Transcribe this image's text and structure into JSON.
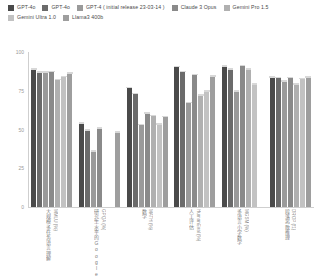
{
  "legend": {
    "items": [
      {
        "label": "GPT-4o",
        "color": "#4a4a4a"
      },
      {
        "label": "GPT-4o",
        "color": "#6b6b6b"
      },
      {
        "label": "GPT-4 ( initial release 23-03-14 )",
        "color": "#9a9a9a"
      },
      {
        "label": "Claude 3 Opus",
        "color": "#8a8a8a"
      },
      {
        "label": "Gemini Pro 1.5",
        "color": "#b0b0b0"
      },
      {
        "label": "Gemini Ultra 1.0",
        "color": "#c2c2c2"
      },
      {
        "label": "Llama3 400b",
        "color": "#9e9e9e"
      }
    ]
  },
  "chart_data": {
    "type": "bar",
    "title": "",
    "xlabel": "",
    "ylabel": "",
    "ylim": [
      0,
      100
    ],
    "yticks": [
      "0",
      "25",
      "50",
      "75",
      "100"
    ],
    "grid": false,
    "legend_position": "top-left",
    "categories": [
      "大规模多任务语言理解 MMLU (%)",
      "研究生水平的Google-Proof问答基准测试 GPQA (%)",
      "数学 MATH (%)",
      "人工评估 HumanEval (%)",
      "多语言小学数学 MGSM (%)",
      "段落离散推理 DROP (f1)"
    ],
    "category_labels": [
      {
        "cjk": "大规模多任务语言理解",
        "latin": "MMLU (%)"
      },
      {
        "cjk": "研究生水平的Google-Proof问答基准测试",
        "latin": "GPQA (%)"
      },
      {
        "cjk": "数学",
        "latin": "MATH (%)"
      },
      {
        "cjk": "人工评估",
        "latin": "HumanEval (%)"
      },
      {
        "cjk": "多语言小学数学",
        "latin": "MGSM (%)"
      },
      {
        "cjk": "段落离散推理",
        "latin": "DROP (f1)"
      }
    ],
    "series": [
      {
        "name": "GPT-4o",
        "color": "#4a4a4a",
        "values": [
          88.7,
          53.6,
          76.6,
          90.2,
          90.5,
          83.4
        ]
      },
      {
        "name": "GPT-4o",
        "color": "#6b6b6b",
        "values": [
          86.6,
          49.1,
          72.6,
          87.1,
          88.5,
          83.1
        ]
      },
      {
        "name": "GPT-4 ( initial release 23-03-14 )",
        "color": "#9a9a9a",
        "values": [
          86.5,
          35.7,
          52.9,
          67.0,
          74.5,
          80.9
        ]
      },
      {
        "name": "Claude 3 Opus",
        "color": "#8a8a8a",
        "values": [
          86.8,
          50.4,
          60.1,
          84.9,
          90.7,
          83.1
        ]
      },
      {
        "name": "Gemini Pro 1.5",
        "color": "#b0b0b0",
        "values": [
          81.9,
          0,
          58.5,
          71.9,
          88.7,
          78.9
        ]
      },
      {
        "name": "Gemini Ultra 1.0",
        "color": "#c2c2c2",
        "values": [
          83.7,
          0,
          53.2,
          74.4,
          79.0,
          82.4
        ]
      },
      {
        "name": "Llama3 400b",
        "color": "#9e9e9e",
        "values": [
          86.1,
          48.0,
          57.8,
          84.1,
          0,
          83.5
        ]
      }
    ]
  }
}
